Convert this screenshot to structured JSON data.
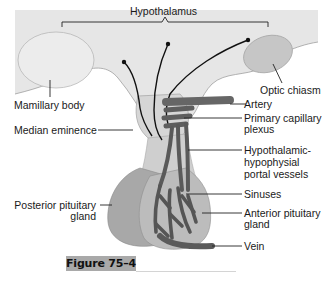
{
  "figure": {
    "caption": "Figure 75–4"
  },
  "labels": {
    "hypothalamus": "Hypothalamus",
    "mamillary_body": "Mamillary body",
    "optic_chiasm": "Optic chiasm",
    "median_eminence": "Median eminence",
    "artery": "Artery",
    "primary_capillary_plexus_1": "Primary capillary",
    "primary_capillary_plexus_2": "plexus",
    "portal_vessels_1": "Hypothalamic-",
    "portal_vessels_2": "hypophysial",
    "portal_vessels_3": "portal vessels",
    "posterior_pituitary_1": "Posterior pituitary",
    "posterior_pituitary_2": "gland",
    "sinuses": "Sinuses",
    "anterior_pituitary_1": "Anterior pituitary",
    "anterior_pituitary_2": "gland",
    "vein": "Vein"
  },
  "colors": {
    "brain_fill": "#e6e6e6",
    "brain_edge": "#9a9a9a",
    "mamillary_fill": "#ececec",
    "optic_fill": "#c8c8c8",
    "stalk_fill": "#d9d9d9",
    "posterior_fill": "#a8a8a8",
    "anterior_fill": "#bcbcbc",
    "vessel": "#5a5a5a",
    "neuron": "#111111",
    "caption_bg": "#a9a9a9"
  }
}
